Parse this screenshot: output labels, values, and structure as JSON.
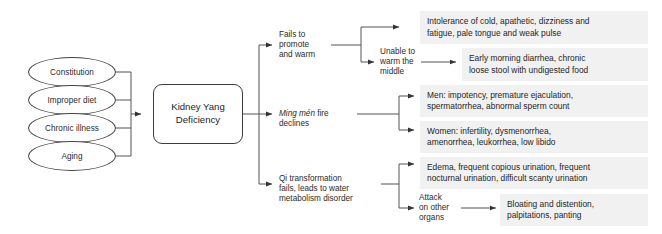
{
  "diagram": {
    "colors": {
      "background": "#ffffff",
      "box_fill": "#f1f1f1",
      "stroke": "#444444",
      "text": "#1f1f1f"
    }
  },
  "causes": [
    {
      "id": "constitution",
      "label": "Constitution"
    },
    {
      "id": "improper-diet",
      "label": "Improper diet"
    },
    {
      "id": "chronic-illness",
      "label": "Chronic illness"
    },
    {
      "id": "aging",
      "label": "Aging"
    }
  ],
  "center": {
    "label": "Kidney Yang\nDeficiency",
    "line1": "Kidney Yang",
    "line2": "Deficiency"
  },
  "mechanisms": [
    {
      "id": "fails-to-promote-and-warm",
      "label": "Fails to\npromote\nand warm"
    },
    {
      "id": "unable-to-warm-the-middle",
      "label": "Unable to\nwarm the\nmiddle"
    },
    {
      "id": "ming-men-fire-declines",
      "italic_part": "Ming mén",
      "rest_part": " fire\ndeclines",
      "label": "Ming mén fire declines"
    },
    {
      "id": "qi-transformation-fails",
      "label": "Qi transformation\nfails, leads to water\nmetabolism disorder"
    },
    {
      "id": "attack-on-other-organs",
      "label": "Attack\non other\norgans"
    }
  ],
  "symptoms": [
    {
      "id": "cold-intolerance",
      "text": "Intolerance of cold, apathetic, dizziness and\nfatigue, pale tongue and weak pulse"
    },
    {
      "id": "early-morning-diarrhea",
      "text": "Early morning diarrhea, chronic\nloose stool with undigested food"
    },
    {
      "id": "men-reproductive",
      "text": "Men: impotency, premature ejaculation,\nspermatorrhea, abnormal sperm count"
    },
    {
      "id": "women-reproductive",
      "text": "Women: infertility, dysmenorrhea,\namenorrhea, leukorrhea, low libido"
    },
    {
      "id": "water-metabolism",
      "text": "Edema, frequent copious urination, frequent\nnocturnal urination, difficult scanty urination"
    },
    {
      "id": "organ-attack-symptoms",
      "text": "Bloating and distention,\npalpitations, panting"
    }
  ]
}
